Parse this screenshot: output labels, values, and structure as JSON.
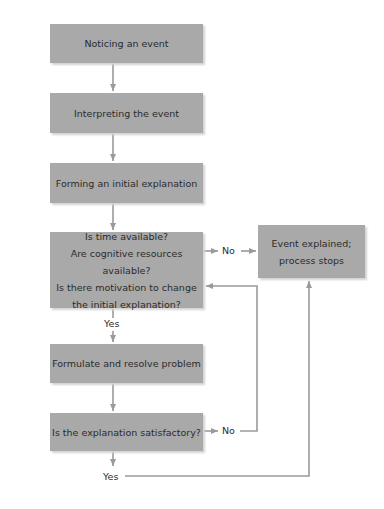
{
  "diagram": {
    "type": "flowchart",
    "colors": {
      "box_fill": "#a9a9a9",
      "connector": "#9a9a9a",
      "text": "#2b2b2b"
    },
    "nodes": [
      {
        "id": "noticing",
        "lines": [
          "Noticing an event"
        ]
      },
      {
        "id": "interpreting",
        "lines": [
          "Interpreting the event"
        ]
      },
      {
        "id": "forming",
        "lines": [
          "Forming an initial explanation"
        ]
      },
      {
        "id": "decision",
        "lines": [
          "Is time available?",
          "Are cognitive resources available?",
          "Is there motivation to change",
          "the initial explanation?"
        ]
      },
      {
        "id": "explained",
        "lines": [
          "Event explained;",
          "process stops"
        ]
      },
      {
        "id": "formulate",
        "lines": [
          "Formulate and resolve problem"
        ]
      },
      {
        "id": "satisfactory",
        "lines": [
          "Is the explanation satisfactory?"
        ]
      }
    ],
    "edge_labels": {
      "decision_no": "No",
      "decision_yes": "Yes",
      "satisfactory_no": "No",
      "satisfactory_yes": "Yes"
    },
    "edges": [
      {
        "from": "noticing",
        "to": "interpreting"
      },
      {
        "from": "interpreting",
        "to": "forming"
      },
      {
        "from": "forming",
        "to": "decision"
      },
      {
        "from": "decision",
        "to": "explained",
        "label": "No"
      },
      {
        "from": "decision",
        "to": "formulate",
        "label": "Yes"
      },
      {
        "from": "formulate",
        "to": "satisfactory"
      },
      {
        "from": "satisfactory",
        "to": "decision",
        "label": "No"
      },
      {
        "from": "satisfactory",
        "to": "explained",
        "label": "Yes"
      }
    ]
  }
}
